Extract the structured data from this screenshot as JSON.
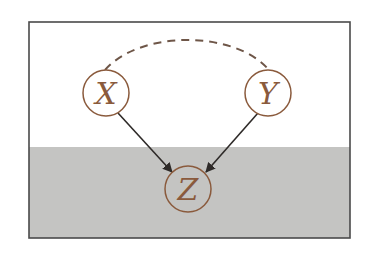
{
  "diagram": {
    "type": "causal-graph",
    "frame": {
      "x": 29,
      "y": 22,
      "width": 321,
      "height": 216,
      "border_color": "#4a4a4a",
      "background_top": "#ffffff",
      "background_bottom": "#c4c4c2",
      "shade_start_y": 147
    },
    "colors": {
      "node_stroke": "#8a5a3c",
      "node_text": "#8a5a3c",
      "arrow": "#2e2a28",
      "dashed_edge": "#6e5648"
    },
    "nodes": [
      {
        "id": "X",
        "label": "X",
        "cx": 106,
        "cy": 93,
        "r": 23,
        "observed": false
      },
      {
        "id": "Y",
        "label": "Y",
        "cx": 268,
        "cy": 93,
        "r": 23,
        "observed": false
      },
      {
        "id": "Z",
        "label": "Z",
        "cx": 188,
        "cy": 189,
        "r": 23,
        "observed": true
      }
    ],
    "edges": [
      {
        "from": "X",
        "to": "Z",
        "style": "solid",
        "directed": true
      },
      {
        "from": "Y",
        "to": "Z",
        "style": "solid",
        "directed": true
      },
      {
        "from": "X",
        "to": "Y",
        "style": "dashed",
        "directed": false,
        "shape": "arc"
      }
    ]
  }
}
